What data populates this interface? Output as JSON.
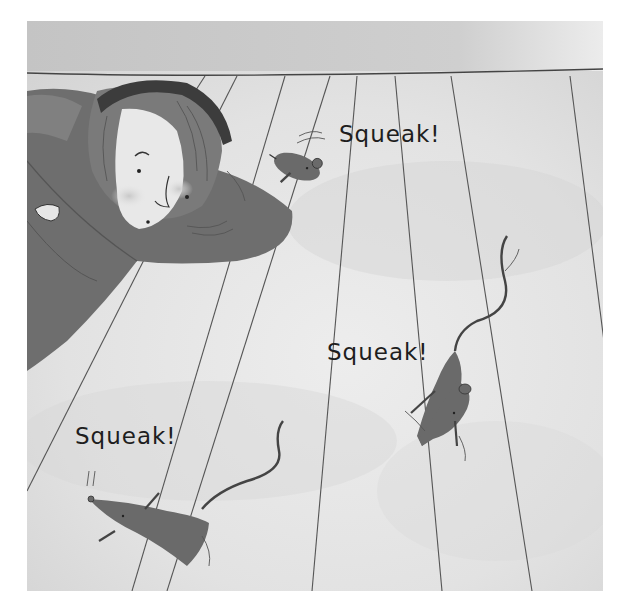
{
  "scene": {
    "description": "Grayscale picture-book illustration: a girl lies on a wooden floor peering at three mice scurrying away",
    "palette": {
      "wall": "#c9c9c9",
      "floor_light": "#e6e6e6",
      "floor_shadow": "#d4d4d4",
      "plank_line": "#555555",
      "coat": "#6e6e6e",
      "coat_dark": "#555555",
      "hair": "#7a7a7a",
      "headband": "#3c3c3c",
      "skin": "#e8e8e8",
      "mouse": "#6a6a6a",
      "ink": "#1e1e1e"
    }
  },
  "captions": [
    {
      "id": "squeak-top",
      "text": "Squeak!"
    },
    {
      "id": "squeak-middle",
      "text": "Squeak!"
    },
    {
      "id": "squeak-bottom",
      "text": "Squeak!"
    }
  ],
  "characters": {
    "girl": {
      "label": "girl lying on floor"
    },
    "mice": [
      {
        "label": "mouse near girl"
      },
      {
        "label": "mouse running right"
      },
      {
        "label": "mouse running bottom-left"
      }
    ]
  }
}
